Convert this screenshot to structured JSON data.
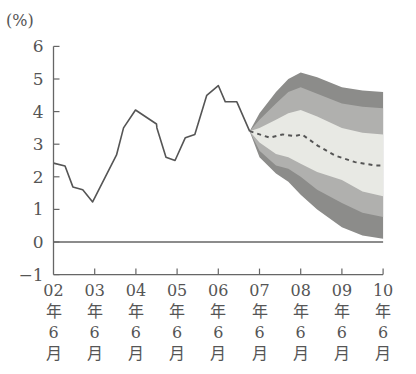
{
  "chart_data": {
    "type": "line",
    "title": "",
    "unit_label": "(%)",
    "xlabel": "",
    "ylabel": "(%)",
    "ylim": [
      -1,
      6
    ],
    "y_ticks": [
      "6",
      "5",
      "4",
      "3",
      "2",
      "1",
      "0",
      "−1"
    ],
    "y_tick_values": [
      6,
      5,
      4,
      3,
      2,
      1,
      0,
      -1
    ],
    "x_ticks": [
      {
        "year": "02",
        "l1": "年",
        "l2": "6",
        "l3": "月"
      },
      {
        "year": "03",
        "l1": "年",
        "l2": "6",
        "l3": "月"
      },
      {
        "year": "04",
        "l1": "年",
        "l2": "6",
        "l3": "月"
      },
      {
        "year": "05",
        "l1": "年",
        "l2": "6",
        "l3": "月"
      },
      {
        "year": "06",
        "l1": "年",
        "l2": "6",
        "l3": "月"
      },
      {
        "year": "07",
        "l1": "年",
        "l2": "6",
        "l3": "月"
      },
      {
        "year": "08",
        "l1": "年",
        "l2": "6",
        "l3": "月"
      },
      {
        "year": "09",
        "l1": "年",
        "l2": "6",
        "l3": "月"
      },
      {
        "year": "10",
        "l1": "年",
        "l2": "6",
        "l3": "月"
      }
    ],
    "x_unit": "years since 2002/6",
    "grid": false,
    "zero_line": true,
    "series": [
      {
        "name": "actual",
        "style": "solid",
        "color": "#555555",
        "x": [
          0.0,
          0.28,
          0.47,
          0.71,
          0.95,
          1.53,
          1.7,
          1.99,
          2.5,
          2.51,
          2.73,
          2.95,
          3.2,
          3.43,
          3.72,
          4.0,
          4.17,
          4.45,
          4.76
        ],
        "y": [
          2.42,
          2.33,
          1.69,
          1.6,
          1.23,
          2.67,
          3.5,
          4.05,
          3.62,
          3.5,
          2.6,
          2.5,
          3.2,
          3.3,
          4.5,
          4.8,
          4.3,
          4.3,
          3.4
        ]
      },
      {
        "name": "projection-median",
        "style": "dashed",
        "color": "#555555",
        "x": [
          4.76,
          5.25,
          5.56,
          5.86,
          6.03,
          6.42,
          6.84,
          7.32,
          7.8,
          8.0
        ],
        "y": [
          3.4,
          3.2,
          3.3,
          3.25,
          3.3,
          2.95,
          2.65,
          2.45,
          2.35,
          2.35
        ]
      }
    ],
    "fan_bands": {
      "x": [
        4.76,
        5.0,
        5.4,
        5.7,
        6.0,
        6.4,
        7.0,
        7.5,
        8.0
      ],
      "outer_upper": [
        3.4,
        3.95,
        4.6,
        5.0,
        5.2,
        5.05,
        4.75,
        4.65,
        4.6
      ],
      "mid_upper": [
        3.4,
        3.75,
        4.25,
        4.6,
        4.75,
        4.55,
        4.25,
        4.15,
        4.1
      ],
      "inner_upper": [
        3.4,
        3.5,
        3.75,
        3.95,
        4.05,
        3.85,
        3.5,
        3.35,
        3.3
      ],
      "inner_lower": [
        3.4,
        3.05,
        2.7,
        2.6,
        2.4,
        2.15,
        1.9,
        1.55,
        1.4
      ],
      "mid_lower": [
        3.4,
        2.8,
        2.35,
        2.25,
        2.0,
        1.6,
        1.2,
        0.9,
        0.77
      ],
      "outer_lower": [
        3.4,
        2.6,
        2.1,
        1.85,
        1.45,
        1.0,
        0.45,
        0.2,
        0.1
      ],
      "colors": {
        "outer": "#8c8c8a",
        "mid": "#b0b0ae",
        "inner": "#e8e9e4"
      }
    }
  }
}
